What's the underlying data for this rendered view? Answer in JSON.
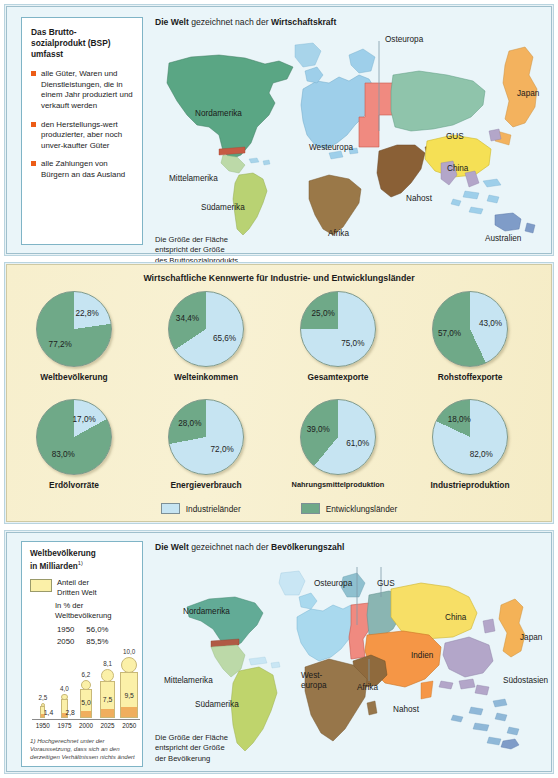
{
  "bsp_box": {
    "title": "Das Brutto-\nsozialprodukt (BSP)\numfasst",
    "bullet_color": "#ec5c16",
    "items": [
      "alle Güter, Waren und Dienstleistungen, die in einem Jahr produziert und verkauft werden",
      "den Herstellungs-wert produzierter, aber noch unver-kaufter Güter",
      "alle Zahlungen von Bürgern an das Ausland"
    ]
  },
  "top_map": {
    "title_plain": " gezeichnet nach der ",
    "title_b1": "Die Welt",
    "title_b2": "Wirtschaftskraft",
    "note": "Die Größe der Fläche\nentspricht der Größe\ndes Bruttosozialprodukts",
    "labels": [
      {
        "name": "Nordamerika",
        "x": 42,
        "y": 78
      },
      {
        "name": "Mittelamerika",
        "x": 18,
        "y": 143
      },
      {
        "name": "Südamerika",
        "x": 50,
        "y": 172
      },
      {
        "name": "Afrika",
        "x": 175,
        "y": 198
      },
      {
        "name": "Westeuropa",
        "x": 176,
        "y": 112
      },
      {
        "name": "Osteuropa",
        "x": 232,
        "y": 24
      },
      {
        "name": "GUS",
        "x": 293,
        "y": 101
      },
      {
        "name": "Nahost",
        "x": 253,
        "y": 163
      },
      {
        "name": "China",
        "x": 294,
        "y": 133
      },
      {
        "name": "Japan",
        "x": 364,
        "y": 58
      },
      {
        "name": "Australien",
        "x": 332,
        "y": 203
      }
    ]
  },
  "pies": {
    "title": "Wirtschaftliche Kennwerte für Industrie- und Entwicklungsländer",
    "legend": [
      {
        "label": "Industrieländer",
        "color": "#c6e4f2"
      },
      {
        "label": "Entwicklungsländer",
        "color": "#6fa988"
      }
    ],
    "items": [
      {
        "name": "Weltbevölkerung",
        "industrie": 22.8,
        "entwicklung": 77.2,
        "industrie_label": "22,8%",
        "entwicklung_label": "77,2%"
      },
      {
        "name": "Welteinkommen",
        "industrie": 65.6,
        "entwicklung": 34.4,
        "industrie_label": "65,6%",
        "entwicklung_label": "34,4%"
      },
      {
        "name": "Gesamtexporte",
        "industrie": 75.0,
        "entwicklung": 25.0,
        "industrie_label": "75,0%",
        "entwicklung_label": "25,0%"
      },
      {
        "name": "Rohstoffexporte",
        "industrie": 43.0,
        "entwicklung": 57.0,
        "industrie_label": "43,0%",
        "entwicklung_label": "57,0%"
      },
      {
        "name": "Erdölvorräte",
        "industrie": 17.0,
        "entwicklung": 83.0,
        "industrie_label": "17,0%",
        "entwicklung_label": "83,0%"
      },
      {
        "name": "Energieverbrauch",
        "industrie": 72.0,
        "entwicklung": 28.0,
        "industrie_label": "72,0%",
        "entwicklung_label": "28,0%"
      },
      {
        "name": "Nahrungsmittelproduktion",
        "industrie": 61.0,
        "entwicklung": 39.0,
        "industrie_label": "61,0%",
        "entwicklung_label": "39,0%"
      },
      {
        "name": "Industrieproduktion",
        "industrie": 82.0,
        "entwicklung": 18.0,
        "industrie_label": "82,0%",
        "entwicklung_label": "18,0%"
      }
    ]
  },
  "pop_box": {
    "title": "Weltbevölkerung\nin Milliarden",
    "title_sup": "1)",
    "legend_label": "Anteil der\nDritten Welt",
    "swatch_color": "#fbf0a8",
    "subheader": "In % der\nWeltbevölkerung",
    "rows": [
      {
        "year": "1950",
        "pct": "56,0%"
      },
      {
        "year": "2050",
        "pct": "85,5%"
      }
    ],
    "bars": [
      {
        "year": "1950",
        "total": "2,5",
        "third": "1,4",
        "total_v": 2.5,
        "third_v": 1.4
      },
      {
        "year": "1975",
        "total": "4,0",
        "third": "2,8",
        "total_v": 4.0,
        "third_v": 2.8
      },
      {
        "year": "2000",
        "total": "6,2",
        "third": "5,0",
        "total_v": 6.2,
        "third_v": 5.0
      },
      {
        "year": "2025",
        "total": "8,1",
        "third": "7,5",
        "total_v": 8.1,
        "third_v": 7.5
      },
      {
        "year": "2050",
        "total": "10,0",
        "third": "9,5",
        "total_v": 10.0,
        "third_v": 9.5
      }
    ],
    "footnote_marker": "1)",
    "footnote": "Hochgerechnet unter der Voraussetzung, dass sich an den derzeitigen Verhältnissen nichts ändert"
  },
  "bottom_map": {
    "title_plain": " gezeichnet nach der ",
    "title_b1": "Die Welt",
    "title_b2": "Bevölkerungszahl",
    "note": "Die Größe der Fläche\nentspricht der Größe\nder Bevölkerung",
    "labels": [
      {
        "name": "Nordamerika",
        "x": 30,
        "y": 52
      },
      {
        "name": "Mittelamerika",
        "x": 11,
        "y": 121
      },
      {
        "name": "Südamerika",
        "x": 42,
        "y": 145
      },
      {
        "name": "West-\neuropa",
        "x": 148,
        "y": 116
      },
      {
        "name": "Afrika",
        "x": 204,
        "y": 128
      },
      {
        "name": "Osteuropa",
        "x": 161,
        "y": 24
      },
      {
        "name": "GUS",
        "x": 224,
        "y": 24
      },
      {
        "name": "Nahost",
        "x": 240,
        "y": 150
      },
      {
        "name": "China",
        "x": 292,
        "y": 58
      },
      {
        "name": "Indien",
        "x": 258,
        "y": 96
      },
      {
        "name": "Japan",
        "x": 367,
        "y": 78
      },
      {
        "name": "Südostasien",
        "x": 350,
        "y": 121
      }
    ]
  }
}
